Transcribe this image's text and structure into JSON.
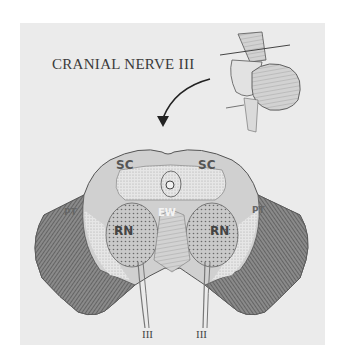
{
  "figure": {
    "title": "CRANIAL NERVE III",
    "labels": {
      "sc_left": "SC",
      "sc_right": "SC",
      "ew": "EW",
      "rn_left": "RN",
      "rn_right": "RN",
      "pt_left": "PT",
      "pt_right": "PT",
      "nerve_left": "III",
      "nerve_right": "III"
    },
    "colors": {
      "panel_bg": "#ebebeb",
      "page_bg": "#ffffff",
      "ink": "#3a3a3a"
    }
  }
}
